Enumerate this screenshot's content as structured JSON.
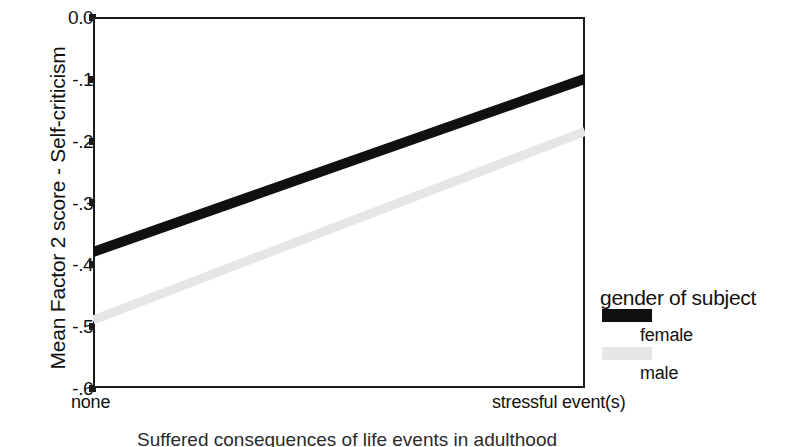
{
  "chart_data": {
    "type": "line",
    "title": "",
    "xlabel": "",
    "ylabel": "Mean Factor 2 score - Self-criticism",
    "categories": [
      "none",
      "stressful event(s)"
    ],
    "x_tick_labels": [
      "none",
      "stressful event(s)"
    ],
    "y_tick_labels": [
      "0.0",
      "-.1",
      "-.2",
      "-.3",
      "-.4",
      "-.5",
      "-.6"
    ],
    "y_tick_values": [
      0.0,
      -0.1,
      -0.2,
      -0.3,
      -0.4,
      -0.5,
      -0.6
    ],
    "ylim": [
      -0.6,
      0.0
    ],
    "grid": false,
    "legend_position": "right",
    "legend_title": "gender of subject",
    "series": [
      {
        "name": "female",
        "values": [
          -0.38,
          -0.1
        ],
        "color": "#101010",
        "line_width": "thick"
      },
      {
        "name": "male",
        "values": [
          -0.49,
          -0.185
        ],
        "color": "#e6e6e6",
        "line_width": "thick"
      }
    ]
  },
  "axes": {
    "y_title": "Mean Factor 2 score - Self-criticism",
    "y_ticks": [
      "0.0",
      "-.1",
      "-.2",
      "-.3",
      "-.4",
      "-.5",
      "-.6"
    ],
    "x_tick_left": "none",
    "x_tick_right": "stressful event(s)"
  },
  "legend": {
    "title": "gender of subject",
    "entries": [
      {
        "label": "female",
        "swatch": "black-swatch"
      },
      {
        "label": "male",
        "swatch": "light-gray-swatch"
      }
    ]
  },
  "caption": {
    "text": "Suffered consequences of life events in adulthood"
  },
  "colors": {
    "female_line": "#101010",
    "male_line": "#e6e6e6",
    "axis": "#1a1a1a",
    "background": "#ffffff"
  }
}
